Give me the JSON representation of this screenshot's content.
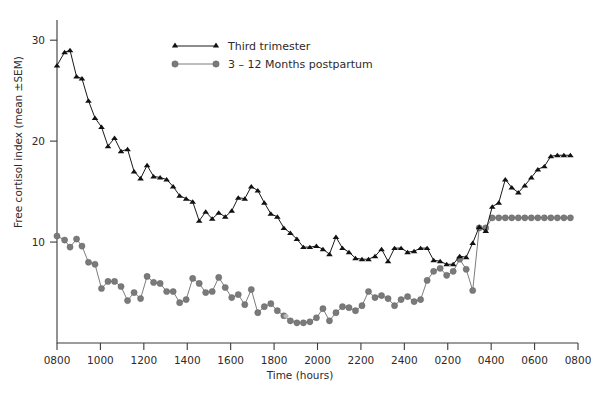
{
  "chart_data": {
    "type": "line",
    "title": "",
    "xlabel": "Time (hours)",
    "ylabel": "Free cortisol index (mean  ±SEM)",
    "grid": false,
    "legend_position": "top-center",
    "xlim": [
      0,
      24
    ],
    "ylim": [
      0,
      32
    ],
    "yticks": [
      10,
      20,
      30
    ],
    "ytick_labels": [
      "10",
      "20",
      "30"
    ],
    "xticks": [
      0,
      2,
      4,
      6,
      8,
      10,
      12,
      14,
      16,
      18,
      20,
      22,
      24
    ],
    "xtick_labels": [
      "0800",
      "1000",
      "1200",
      "1400",
      "1600",
      "1800",
      "2000",
      "2200",
      "2400",
      "0200",
      "0400",
      "0600",
      "0800"
    ],
    "series": [
      {
        "name": "Third trimester",
        "marker": "triangle",
        "color": "#111111",
        "x": [
          0.0,
          0.35,
          0.6,
          0.9,
          1.15,
          1.45,
          1.75,
          2.05,
          2.35,
          2.65,
          2.95,
          3.25,
          3.55,
          3.85,
          4.15,
          4.45,
          4.75,
          5.05,
          5.35,
          5.65,
          5.95,
          6.25,
          6.55,
          6.85,
          7.15,
          7.45,
          7.75,
          8.05,
          8.35,
          8.65,
          8.95,
          9.25,
          9.55,
          9.85,
          10.15,
          10.45,
          10.75,
          11.05,
          11.35,
          11.65,
          11.95,
          12.25,
          12.55,
          12.85,
          13.15,
          13.45,
          13.75,
          14.05,
          14.35,
          14.65,
          14.95,
          15.25,
          15.55,
          15.85,
          16.15,
          16.45,
          16.75,
          17.05,
          17.35,
          17.65,
          17.95,
          18.25,
          18.55,
          18.85,
          19.15,
          19.45,
          19.75,
          20.05,
          20.35,
          20.65,
          20.95,
          21.25,
          21.55,
          21.85,
          22.15,
          22.45,
          22.75,
          23.05,
          23.35,
          23.65
        ],
        "y": [
          27.5,
          28.8,
          29.0,
          26.4,
          26.2,
          24.0,
          22.3,
          21.4,
          19.5,
          20.3,
          19.0,
          19.2,
          17.0,
          16.3,
          17.6,
          16.5,
          16.4,
          16.2,
          15.5,
          14.6,
          14.3,
          14.0,
          12.1,
          13.0,
          12.3,
          12.9,
          12.5,
          13.1,
          14.4,
          14.3,
          15.5,
          15.1,
          13.9,
          12.8,
          12.5,
          11.4,
          10.9,
          10.3,
          9.5,
          9.5,
          9.6,
          9.3,
          8.8,
          10.5,
          9.4,
          9.0,
          8.4,
          8.3,
          8.3,
          8.6,
          9.3,
          8.1,
          9.4,
          9.4,
          9.0,
          9.1,
          9.4,
          9.4,
          8.2,
          8.1,
          7.8,
          7.8,
          8.6,
          8.5,
          9.9,
          11.5,
          11.1,
          13.5,
          13.9,
          16.2,
          15.4,
          14.9,
          15.6,
          16.4,
          17.2,
          17.5,
          18.5,
          18.6,
          18.6,
          18.6
        ]
      },
      {
        "name": "3 – 12 Months postpartum",
        "marker": "circle",
        "color": "#7a7a7a",
        "x": [
          0.0,
          0.35,
          0.6,
          0.9,
          1.15,
          1.45,
          1.75,
          2.05,
          2.35,
          2.65,
          2.95,
          3.25,
          3.55,
          3.85,
          4.15,
          4.45,
          4.75,
          5.05,
          5.35,
          5.65,
          5.95,
          6.25,
          6.55,
          6.85,
          7.15,
          7.45,
          7.75,
          8.05,
          8.35,
          8.65,
          8.95,
          9.25,
          9.55,
          9.85,
          10.15,
          10.45,
          10.75,
          11.05,
          11.35,
          11.65,
          11.95,
          12.25,
          12.55,
          12.85,
          13.15,
          13.45,
          13.75,
          14.05,
          14.35,
          14.65,
          14.95,
          15.25,
          15.55,
          15.85,
          16.15,
          16.45,
          16.75,
          17.05,
          17.35,
          17.65,
          17.95,
          18.25,
          18.55,
          18.85,
          19.15,
          19.45,
          19.75,
          20.05,
          20.35,
          20.65,
          20.95,
          21.25,
          21.55,
          21.85,
          22.15,
          22.45,
          22.75,
          23.05,
          23.35,
          23.65
        ],
        "y": [
          10.6,
          10.2,
          9.5,
          10.3,
          9.6,
          8.0,
          7.8,
          5.4,
          6.1,
          6.1,
          5.6,
          4.2,
          5.0,
          4.4,
          6.6,
          6.0,
          5.9,
          5.1,
          5.1,
          4.0,
          4.3,
          6.4,
          5.9,
          5.0,
          5.1,
          6.5,
          5.5,
          4.5,
          4.8,
          3.8,
          5.3,
          3.0,
          3.6,
          3.9,
          3.2,
          2.7,
          2.2,
          2.0,
          2.0,
          2.1,
          2.5,
          3.4,
          2.2,
          3.0,
          3.6,
          3.5,
          3.2,
          3.7,
          5.1,
          4.5,
          4.7,
          4.4,
          3.7,
          4.3,
          4.6,
          4.1,
          4.3,
          6.2,
          7.1,
          7.4,
          6.7,
          7.1,
          8.3,
          7.3,
          5.2,
          11.4,
          11.4,
          12.4,
          12.4,
          12.4,
          12.4,
          12.4,
          12.4,
          12.4,
          12.4,
          12.4,
          12.4,
          12.4,
          12.4,
          12.4
        ]
      }
    ]
  },
  "legend": {
    "entries": [
      {
        "label": "Third trimester",
        "marker": "triangle-marker"
      },
      {
        "label": "3 – 12 Months postpartum",
        "marker": "circle-marker"
      }
    ]
  },
  "axes": {
    "x_title": "Time (hours)",
    "y_title": "Free cortisol index (mean  ±SEM)"
  },
  "colors": {
    "series_a": "#111111",
    "series_b": "#7a7a7a",
    "axis": "#3b3b3b",
    "text": "#2e2a2b",
    "background": "#ffffff"
  }
}
